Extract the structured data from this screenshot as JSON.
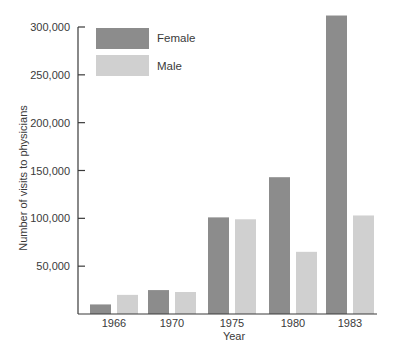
{
  "chart_data": {
    "type": "bar",
    "title": "",
    "xlabel": "Year",
    "ylabel": "Number of visits to physicians",
    "categories": [
      "1966",
      "1970",
      "1975",
      "1980",
      "1983"
    ],
    "series": [
      {
        "name": "Female",
        "color": "#8c8c8c",
        "values": [
          10000,
          25000,
          101000,
          143000,
          312000
        ]
      },
      {
        "name": "Male",
        "color": "#d0d0d0",
        "values": [
          20000,
          23000,
          99000,
          65000,
          103000
        ]
      }
    ],
    "yticks": [
      50000,
      100000,
      150000,
      200000,
      250000,
      300000
    ],
    "ytick_labels": [
      "50,000",
      "100,000",
      "150,000",
      "200,000",
      "250,000",
      "300,000"
    ],
    "ylim": [
      0,
      300000
    ],
    "grid": false,
    "legend_position": "upper-left"
  },
  "legend": {
    "female_label": "Female",
    "male_label": "Male"
  },
  "axes": {
    "xlabel": "Year",
    "ylabel": "Number of visits to physicians"
  }
}
